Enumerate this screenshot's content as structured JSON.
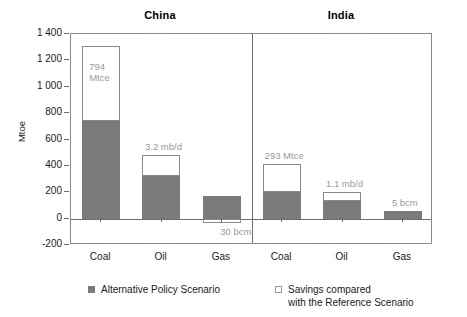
{
  "chart_data": {
    "type": "bar",
    "title": "",
    "xlabel": "",
    "ylabel": "Mtoe",
    "ylim": [
      -200,
      1400
    ],
    "ytick_values": [
      1400,
      1200,
      1000,
      800,
      600,
      400,
      200,
      0,
      -200
    ],
    "ytick_labels": [
      "1 400",
      "1 200",
      "1 000",
      "800",
      "600",
      "400",
      "200",
      "0",
      "-200"
    ],
    "grid": false,
    "stacked": true,
    "legend_position": "bottom",
    "groups": [
      {
        "label": "China"
      },
      {
        "label": "India"
      }
    ],
    "categories": [
      "Coal",
      "Oil",
      "Gas",
      "Coal",
      "Oil",
      "Gas"
    ],
    "series": [
      {
        "name": "Alternative Policy Scenario",
        "color": "#7a7a7a",
        "values": [
          737,
          324,
          175,
          199,
          135,
          58
        ]
      },
      {
        "name": "Savings compared with the Reference Scenario",
        "color": "#ffffff",
        "values": [
          571,
          160,
          -33,
          212,
          65,
          0
        ]
      }
    ],
    "bars": [
      {
        "group": "China",
        "category": "Coal",
        "base_value": 737,
        "savings_value": 571,
        "total_value": 1308,
        "annotation": "794\nMtce",
        "annotation_position": "inside-savings"
      },
      {
        "group": "China",
        "category": "Oil",
        "base_value": 324,
        "savings_value": 160,
        "total_value": 484,
        "annotation": "3.2 mb/d",
        "annotation_position": "above"
      },
      {
        "group": "China",
        "category": "Gas",
        "base_value": 175,
        "savings_value": -33,
        "total_value": 175,
        "annotation": "30 bcm",
        "annotation_position": "below-zero"
      },
      {
        "group": "India",
        "category": "Coal",
        "base_value": 199,
        "savings_value": 212,
        "total_value": 411,
        "annotation": "293 Mtce",
        "annotation_position": "above"
      },
      {
        "group": "India",
        "category": "Oil",
        "base_value": 135,
        "savings_value": 65,
        "total_value": 200,
        "annotation": "1.1 mb/d",
        "annotation_position": "above"
      },
      {
        "group": "India",
        "category": "Gas",
        "base_value": 58,
        "savings_value": 0,
        "total_value": 58,
        "annotation": "5 bcm",
        "annotation_position": "above"
      }
    ],
    "annotations": [
      "794 Mtce",
      "3.2 mb/d",
      "30 bcm",
      "293 Mtce",
      "1.1 mb/d",
      "5 bcm"
    ],
    "colors": {
      "bar_fill": "#7a7a7a",
      "savings_fill": "#ffffff",
      "savings_stroke": "#8a8a8a",
      "axis": "#6e6e6e",
      "annotation_text": "#9a9a9a",
      "text": "#1a1a1a"
    }
  },
  "legend": {
    "items": [
      {
        "label": "Alternative Policy Scenario",
        "swatch": "filled"
      },
      {
        "label": "Savings compared\nwith the Reference Scenario",
        "swatch": "outlined"
      }
    ]
  }
}
